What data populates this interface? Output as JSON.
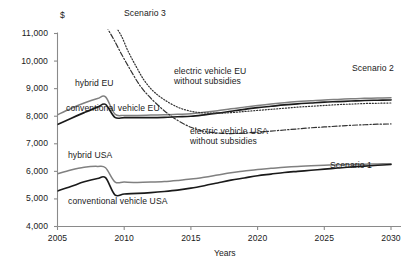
{
  "chart_data": {
    "type": "line",
    "title": "",
    "xlabel": "Years",
    "ylabel": "$",
    "yunit": "$",
    "xlim": [
      2005,
      2030
    ],
    "ylim": [
      4000,
      11000
    ],
    "grid": false,
    "legend_position": "inline-annotations",
    "xticks": [
      "2005",
      "2010",
      "2015",
      "2020",
      "2025",
      "2030"
    ],
    "xtick_values": [
      2005,
      2010,
      2015,
      2020,
      2025,
      2030
    ],
    "yticks": [
      "4,000",
      "5,000",
      "6,000",
      "7,000",
      "8,000",
      "9,000",
      "10,000",
      "11,000"
    ],
    "ytick_values": [
      4000,
      5000,
      6000,
      7000,
      8000,
      9000,
      10000,
      11000
    ],
    "annotations": [
      {
        "text": "Scenario 3",
        "x": 2011.5,
        "y": 11050
      },
      {
        "text": "Scenario 2",
        "x": 2028.0,
        "y": 8950
      },
      {
        "text": "Scenario 1",
        "x": 2027.8,
        "y": 6500
      },
      {
        "text": "hybrid EU",
        "x": 2007.0,
        "y": 8800
      },
      {
        "text": "conventional vehicle EU",
        "x": 2006.3,
        "y": 7550
      },
      {
        "text": "hybrid USA",
        "x": 2006.6,
        "y": 6450
      },
      {
        "text": "conventional vehicle USA",
        "x": 2006.5,
        "y": 4950
      },
      {
        "text": "electric vehicle EU without subsidies",
        "x": 2018.0,
        "y": 9200
      },
      {
        "text": "electric vehicle USA without subsidies",
        "x": 2019.0,
        "y": 7800
      }
    ],
    "series": [
      {
        "name": "hybrid EU",
        "style": "solid-grey",
        "color": "#808080",
        "x": [
          2005,
          2006,
          2007,
          2008,
          2008.6,
          2009.3,
          2010,
          2011,
          2012,
          2013,
          2014,
          2015,
          2016,
          2017,
          2018,
          2019,
          2020,
          2021,
          2022,
          2023,
          2024,
          2025,
          2026,
          2027,
          2028,
          2029,
          2030
        ],
        "values": [
          8050,
          8280,
          8480,
          8640,
          8700,
          8080,
          8030,
          8030,
          8040,
          8050,
          8070,
          8090,
          8140,
          8200,
          8270,
          8330,
          8390,
          8440,
          8490,
          8530,
          8560,
          8590,
          8610,
          8630,
          8650,
          8660,
          8670
        ]
      },
      {
        "name": "conventional vehicle EU",
        "style": "solid-black",
        "color": "#1a1a1a",
        "x": [
          2005,
          2006,
          2007,
          2008,
          2008.6,
          2009.3,
          2010,
          2011,
          2012,
          2013,
          2014,
          2015,
          2016,
          2017,
          2018,
          2019,
          2020,
          2021,
          2022,
          2023,
          2024,
          2025,
          2026,
          2027,
          2028,
          2029,
          2030
        ],
        "values": [
          7700,
          7920,
          8130,
          8330,
          8430,
          7960,
          7950,
          7950,
          7950,
          7960,
          7980,
          8000,
          8050,
          8110,
          8180,
          8250,
          8310,
          8360,
          8410,
          8450,
          8480,
          8510,
          8530,
          8550,
          8570,
          8580,
          8590
        ]
      },
      {
        "name": "electric vehicle EU without subsidies",
        "style": "dotted",
        "color": "#333333",
        "x": [
          2009.3,
          2009.8,
          2010.3,
          2010.9,
          2011.5,
          2012.2,
          2013,
          2014,
          2015,
          2016,
          2017,
          2018,
          2019,
          2020,
          2021,
          2022,
          2023,
          2024,
          2025,
          2026,
          2027,
          2028,
          2029,
          2030
        ],
        "values": [
          11300,
          10900,
          10350,
          9800,
          9300,
          8900,
          8600,
          8330,
          8180,
          8120,
          8110,
          8130,
          8170,
          8210,
          8250,
          8290,
          8330,
          8360,
          8390,
          8420,
          8440,
          8460,
          8470,
          8480
        ]
      },
      {
        "name": "electric vehicle USA without subsidies",
        "style": "dash-dot",
        "color": "#333333",
        "x": [
          2008.6,
          2009.2,
          2009.8,
          2010.5,
          2011.2,
          2012,
          2013,
          2014,
          2015,
          2016,
          2017,
          2018,
          2019,
          2020,
          2021,
          2022,
          2023,
          2024,
          2025,
          2026,
          2027,
          2028,
          2029,
          2030
        ],
        "values": [
          11300,
          10800,
          10250,
          9650,
          9100,
          8650,
          8200,
          7850,
          7600,
          7450,
          7390,
          7370,
          7390,
          7420,
          7460,
          7500,
          7540,
          7580,
          7610,
          7640,
          7670,
          7690,
          7710,
          7720
        ]
      },
      {
        "name": "hybrid USA",
        "style": "solid-grey",
        "color": "#808080",
        "x": [
          2005,
          2006,
          2007,
          2008,
          2008.6,
          2009.3,
          2010,
          2011,
          2012,
          2013,
          2014,
          2015,
          2016,
          2017,
          2018,
          2019,
          2020,
          2021,
          2022,
          2023,
          2024,
          2025,
          2026,
          2027,
          2028,
          2029,
          2030
        ],
        "values": [
          5910,
          6050,
          6150,
          6180,
          6130,
          5620,
          5610,
          5600,
          5610,
          5630,
          5670,
          5720,
          5790,
          5870,
          5950,
          6010,
          6070,
          6110,
          6150,
          6180,
          6200,
          6220,
          6240,
          6250,
          6260,
          6270,
          6280
        ]
      },
      {
        "name": "conventional vehicle USA",
        "style": "solid-black",
        "color": "#1a1a1a",
        "x": [
          2005,
          2006,
          2007,
          2008,
          2008.6,
          2009.3,
          2010,
          2011,
          2012,
          2013,
          2014,
          2015,
          2016,
          2017,
          2018,
          2019,
          2020,
          2021,
          2022,
          2023,
          2024,
          2025,
          2026,
          2027,
          2028,
          2029,
          2030
        ],
        "values": [
          5290,
          5450,
          5620,
          5740,
          5770,
          5150,
          5180,
          5200,
          5230,
          5270,
          5320,
          5390,
          5480,
          5580,
          5680,
          5760,
          5840,
          5900,
          5960,
          6000,
          6040,
          6080,
          6120,
          6160,
          6190,
          6220,
          6250
        ]
      }
    ]
  },
  "axis": {
    "unit_label": "$",
    "x_title": "Years"
  }
}
